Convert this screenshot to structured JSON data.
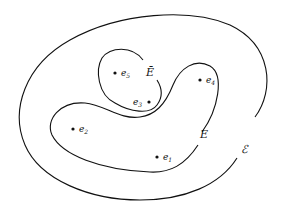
{
  "diagram": {
    "title": "",
    "regions": [
      {
        "id": "outer",
        "label": "ℰ",
        "description": "outer closed curve"
      },
      {
        "id": "E",
        "label": "E",
        "description": "middle closed curve"
      },
      {
        "id": "Ebar",
        "label": "Ē",
        "description": "inner closed curve"
      }
    ],
    "points": [
      {
        "name": "e",
        "sub": "1",
        "x": 157,
        "y": 157
      },
      {
        "name": "e",
        "sub": "2",
        "x": 73,
        "y": 129
      },
      {
        "name": "e",
        "sub": "3",
        "x": 149,
        "y": 102
      },
      {
        "name": "e",
        "sub": "4",
        "x": 200,
        "y": 80
      },
      {
        "name": "e",
        "sub": "5",
        "x": 115,
        "y": 73
      }
    ],
    "colors": {
      "stroke": "#111111",
      "background": "#ffffff"
    }
  }
}
